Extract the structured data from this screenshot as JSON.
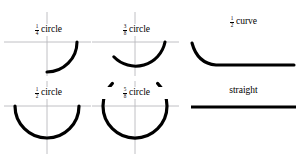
{
  "diagram": {
    "ink_color": "#000000",
    "axis_color": "#b9b9bd",
    "background": "#ffffff",
    "cells": [
      {
        "id": "quarter-circle",
        "label": {
          "numerator": "1",
          "denominator": "4",
          "word": "circle"
        },
        "shape": "arc",
        "arc_fraction": 0.25,
        "axes": true
      },
      {
        "id": "three-eighths-circle",
        "label": {
          "numerator": "3",
          "denominator": "8",
          "word": "circle"
        },
        "shape": "arc",
        "arc_fraction": 0.375,
        "axes": true
      },
      {
        "id": "half-curve",
        "label": {
          "numerator": "1",
          "denominator": "2",
          "word": "curve"
        },
        "shape": "j-curve",
        "axes": false
      },
      {
        "id": "half-circle",
        "label": {
          "numerator": "1",
          "denominator": "2",
          "word": "circle"
        },
        "shape": "arc",
        "arc_fraction": 0.5,
        "axes": true
      },
      {
        "id": "five-eighths-circle",
        "label": {
          "numerator": "5",
          "denominator": "8",
          "word": "circle"
        },
        "shape": "arc",
        "arc_fraction": 0.625,
        "axes": true
      },
      {
        "id": "straight",
        "label": {
          "numerator": "",
          "denominator": "",
          "word": "straight"
        },
        "shape": "line",
        "axes": false
      }
    ]
  }
}
